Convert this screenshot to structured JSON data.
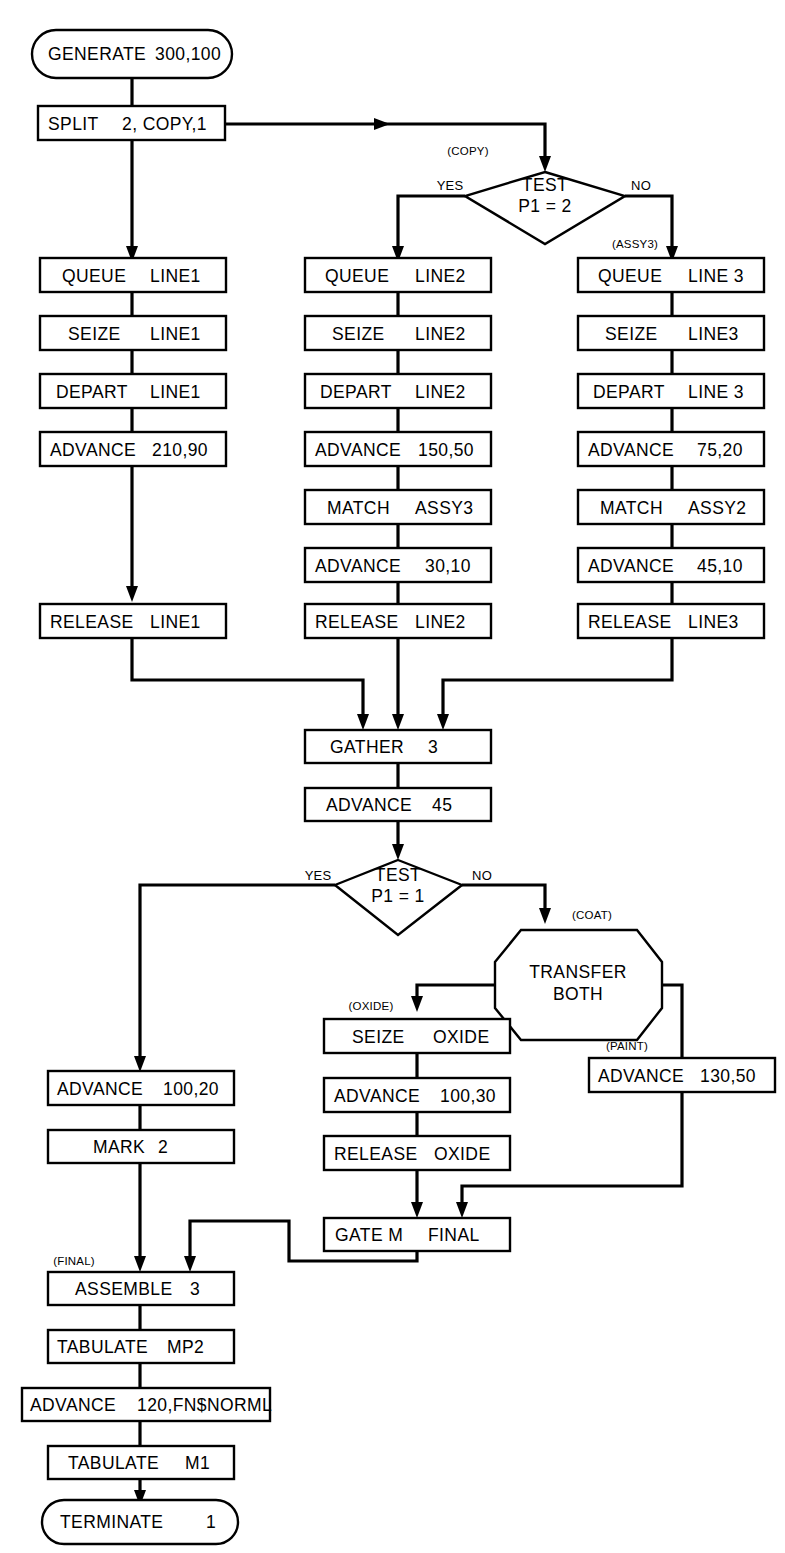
{
  "diagram": {
    "type": "gpss-simulation-block-flowchart",
    "nodes": {
      "generate": {
        "shape": "terminator",
        "op": "GENERATE",
        "operand": "300,100"
      },
      "split": {
        "shape": "process",
        "op": "SPLIT",
        "operand": "2, COPY,1"
      },
      "test_copy": {
        "shape": "decision",
        "line1": "TEST",
        "line2": "P1 = 2",
        "yes": "YES",
        "no": "NO",
        "tag": "(COPY)"
      },
      "queue1": {
        "shape": "process",
        "op": "QUEUE",
        "operand": "LINE1"
      },
      "seize1": {
        "shape": "process",
        "op": "SEIZE",
        "operand": "LINE1"
      },
      "depart1": {
        "shape": "process",
        "op": "DEPART",
        "operand": "LINE1"
      },
      "advance1": {
        "shape": "process",
        "op": "ADVANCE",
        "operand": "210,90"
      },
      "release1": {
        "shape": "process",
        "op": "RELEASE",
        "operand": "LINE1"
      },
      "queue2": {
        "shape": "process",
        "op": "QUEUE",
        "operand": "LINE2"
      },
      "seize2": {
        "shape": "process",
        "op": "SEIZE",
        "operand": "LINE2"
      },
      "depart2": {
        "shape": "process",
        "op": "DEPART",
        "operand": "LINE2"
      },
      "advance2": {
        "shape": "process",
        "op": "ADVANCE",
        "operand": "150,50"
      },
      "match2": {
        "shape": "process",
        "op": "MATCH",
        "operand": "ASSY3"
      },
      "advance2b": {
        "shape": "process",
        "op": "ADVANCE",
        "operand": "30,10"
      },
      "release2": {
        "shape": "process",
        "op": "RELEASE",
        "operand": "LINE2"
      },
      "queue3": {
        "shape": "process",
        "op": "QUEUE",
        "operand": "LINE 3",
        "tag": "(ASSY3)"
      },
      "seize3": {
        "shape": "process",
        "op": "SEIZE",
        "operand": "LINE3"
      },
      "depart3": {
        "shape": "process",
        "op": "DEPART",
        "operand": "LINE 3"
      },
      "advance3": {
        "shape": "process",
        "op": "ADVANCE",
        "operand": "75,20"
      },
      "match3": {
        "shape": "process",
        "op": "MATCH",
        "operand": "ASSY2"
      },
      "advance3b": {
        "shape": "process",
        "op": "ADVANCE",
        "operand": "45,10"
      },
      "release3": {
        "shape": "process",
        "op": "RELEASE",
        "operand": "LINE3"
      },
      "gather": {
        "shape": "process",
        "op": "GATHER",
        "operand": "3"
      },
      "advance45": {
        "shape": "process",
        "op": "ADVANCE",
        "operand": "45"
      },
      "test_final": {
        "shape": "decision",
        "line1": "TEST",
        "line2": "P1 = 1",
        "yes": "YES",
        "no": "NO"
      },
      "transfer": {
        "shape": "hexagon",
        "line1": "TRANSFER",
        "line2": "BOTH",
        "tag": "(COAT)"
      },
      "seize_oxide": {
        "shape": "process",
        "op": "SEIZE",
        "operand": "OXIDE",
        "tag": "(OXIDE)"
      },
      "advance_oxide": {
        "shape": "process",
        "op": "ADVANCE",
        "operand": "100,30"
      },
      "release_oxide": {
        "shape": "process",
        "op": "RELEASE",
        "operand": "OXIDE"
      },
      "advance_paint": {
        "shape": "process",
        "op": "ADVANCE",
        "operand": "130,50",
        "tag": "(PAINT)"
      },
      "gate": {
        "shape": "process",
        "op": "GATE M",
        "operand": "FINAL"
      },
      "advance_left": {
        "shape": "process",
        "op": "ADVANCE",
        "operand": "100,20"
      },
      "mark": {
        "shape": "process",
        "op": "MARK",
        "operand": "2"
      },
      "assemble": {
        "shape": "process",
        "op": "ASSEMBLE",
        "operand": "3",
        "tag": "(FINAL)"
      },
      "tabulate_mp2": {
        "shape": "process",
        "op": "TABULATE",
        "operand": "MP2"
      },
      "advance_norm": {
        "shape": "process",
        "op": "ADVANCE",
        "operand": "120,FN$NORML"
      },
      "tabulate_m1": {
        "shape": "process",
        "op": "TABULATE",
        "operand": "M1"
      },
      "terminate": {
        "shape": "terminator",
        "op": "TERMINATE",
        "operand": "1"
      }
    },
    "colors": {
      "stroke": "#000000",
      "fill": "#ffffff",
      "background": "#ffffff"
    }
  }
}
